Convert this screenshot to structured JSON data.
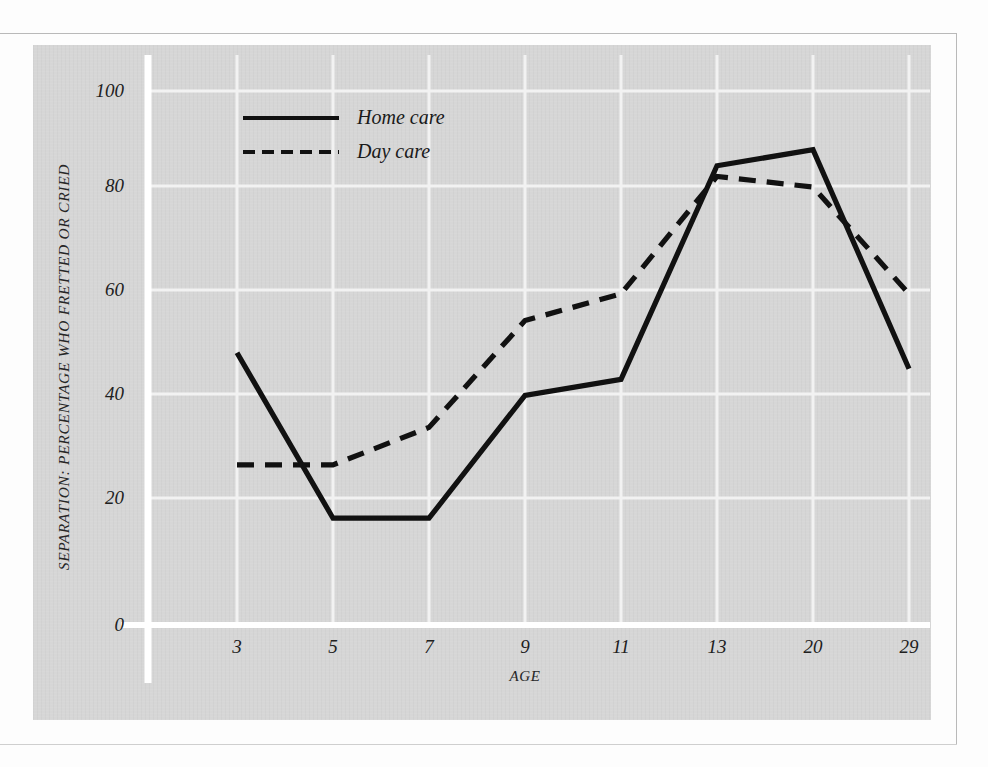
{
  "chart_data": {
    "type": "line",
    "title": "",
    "xlabel": "AGE",
    "ylabel": "SEPARATION: PERCENTAGE WHO FRETTED OR CRIED",
    "categories": [
      "3",
      "5",
      "7",
      "9",
      "11",
      "13",
      "20",
      "29"
    ],
    "x_tick_labels": [
      "3",
      "5",
      "7",
      "9",
      "11",
      "13",
      "20",
      "29"
    ],
    "y_tick_labels": [
      "0",
      "20",
      "40",
      "60",
      "80",
      "100"
    ],
    "ylim": [
      0,
      100
    ],
    "y_ticks": [
      0,
      20,
      40,
      60,
      80,
      100
    ],
    "grid": true,
    "grid_color": "#f2f2f2",
    "legend_position": "top-left-inside",
    "plot_background": "#d6d6d6",
    "line_color": "#111111",
    "series": [
      {
        "name": "Home care",
        "style": "solid",
        "values": [
          51,
          20,
          20,
          43,
          46,
          86,
          89,
          48
        ]
      },
      {
        "name": "Day care",
        "style": "dashed",
        "values": [
          30,
          30,
          37,
          57,
          62,
          84,
          82,
          62
        ]
      }
    ]
  },
  "legend": {
    "items": [
      {
        "label": "Home care",
        "style": "solid"
      },
      {
        "label": "Day care",
        "style": "dashed"
      }
    ]
  },
  "axes": {
    "y_title": "SEPARATION: PERCENTAGE WHO FRETTED OR CRIED",
    "x_title": "AGE",
    "y_labels": [
      "100",
      "80",
      "60",
      "40",
      "20",
      "0"
    ],
    "x_labels": [
      "3",
      "5",
      "7",
      "9",
      "11",
      "13",
      "20",
      "29"
    ]
  }
}
